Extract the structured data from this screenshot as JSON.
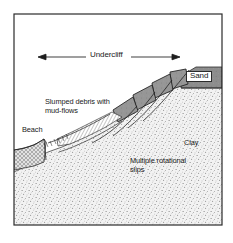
{
  "figure": {
    "type": "geological-cross-section",
    "border_color": "#2b2b2b",
    "background_color": "#ffffff"
  },
  "annotations": {
    "undercliff": "Undercliff",
    "sand": "Sand",
    "slumped_debris": "Slumped debris with\nmud-flows",
    "beach": "Beach",
    "clay": "Clay",
    "rotational_slips": "Multiple rotational\nslips"
  },
  "units": [
    {
      "name": "Sand",
      "fill": "#8a8a8a",
      "position": "cap rock, upper right"
    },
    {
      "name": "Clay",
      "fill": "#e8e8e8",
      "position": "main body, stippled"
    },
    {
      "name": "Beach",
      "fill": "#d0d0d0",
      "position": "lower left wedge, cross-hatched"
    }
  ],
  "features": {
    "slump_blocks": 4,
    "slip_surfaces": 4,
    "mudflow_zone": "hatched band above beach",
    "dimension_arrow": {
      "label": "Undercliff",
      "style": "double-headed"
    }
  },
  "colors": {
    "ink": "#1a1a1a",
    "sand_fill": "#8a8a8a",
    "block_fill": "#949494",
    "beach_fill": "#cfcfcf",
    "clay_stipple": "#777777"
  }
}
